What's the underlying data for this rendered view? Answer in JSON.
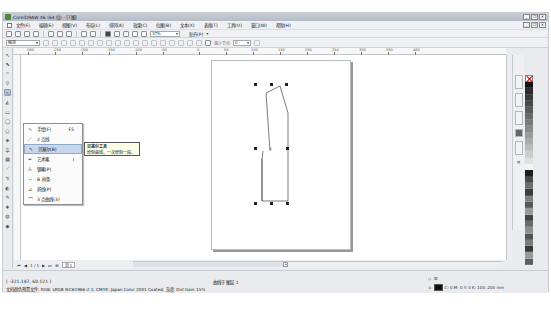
{
  "window": {
    "title": "CorelDRAW X6 (64 位) - [T图]",
    "controls": [
      "_",
      "❐",
      "✕"
    ]
  },
  "menubar": {
    "items": [
      "文件(F)",
      "编辑(E)",
      "视图(V)",
      "布局(L)",
      "排列(A)",
      "效果(C)",
      "位图(B)",
      "文本(X)",
      "表格(T)",
      "工具(O)",
      "窗口(W)",
      "帮助(H)"
    ]
  },
  "standard_toolbar": {
    "zoom_level": "37%",
    "snap_label": "贴齐(P)"
  },
  "property_bar": {
    "preset_value": "缩放",
    "reduce_nodes_label": "减少节点",
    "reduce_nodes_value": "0"
  },
  "ruler": {
    "top_labels": [
      "-300",
      "-250",
      "-200",
      "-150",
      "-100",
      "-50",
      "0",
      "50",
      "100",
      "150",
      "200",
      "250",
      "300",
      "350",
      "400"
    ],
    "unit": "mm"
  },
  "flyout": {
    "items": [
      {
        "label": "手绘(F)",
        "shortcut": "F5",
        "icon": "freehand-icon"
      },
      {
        "label": "2 点线",
        "shortcut": "",
        "icon": "two-point-line-icon"
      },
      {
        "label": "贝塞尔(B)",
        "shortcut": "",
        "icon": "bezier-icon",
        "highlighted": true
      },
      {
        "label": "艺术笔",
        "shortcut": "I",
        "icon": "artistic-media-icon"
      },
      {
        "label": "钢笔(P)",
        "shortcut": "",
        "icon": "pen-icon"
      },
      {
        "label": "B 样条",
        "shortcut": "",
        "icon": "b-spline-icon"
      },
      {
        "label": "折线(P)",
        "shortcut": "",
        "icon": "polyline-icon"
      },
      {
        "label": "3 点曲线(3)",
        "shortcut": "",
        "icon": "three-point-curve-icon"
      }
    ]
  },
  "tooltip": {
    "title": "贝塞尔工具",
    "body": "绘制曲线，一次绘制一段。"
  },
  "page_nav": {
    "page_count": "1 / 1",
    "page_tab": "页 1"
  },
  "statusbar": {
    "coordinates": "( -321.147, 60.121 )",
    "object_info": "曲线于 图层 1",
    "color_profile": "文档颜色预置文件: RGB: sRGB IEC61966-2.1; CMYK: Japan Color 2001 Coated; 灰度: Dot Gain 15%",
    "outline_info": "C: 0 M: 0 Y: 0 K: 100  .200 mm"
  },
  "colors": {
    "palette": [
      "#111111",
      "#2b2b2b",
      "#3a3a3a",
      "#4a4a4a",
      "#5a5a5a",
      "#6a6a6a",
      "#7a7a7a",
      "#8a8a8a",
      "#9b9b9b",
      "#ababab",
      "#bcbcbc",
      "#cccccc",
      "#e0e0e0",
      "#f4f4f4",
      "#1e1e1e",
      "#4b4b4b",
      "#6f6f6f",
      "#3d3d3d",
      "#808080",
      "#565656",
      "#999999",
      "#444444",
      "#6c6c6c",
      "#8e8e8e",
      "#525252",
      "#7b7b7b",
      "#3a3a3a",
      "#9a9a9a",
      "#5e5e5e"
    ],
    "selection_highlight": "#c7d6ea"
  }
}
